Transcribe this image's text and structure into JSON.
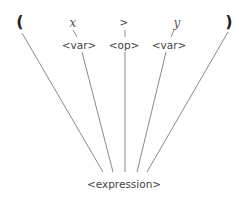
{
  "diagram": {
    "type": "parse-tree",
    "root": {
      "id": "expression",
      "label": "<expression>"
    },
    "leaves": [
      {
        "id": "lparen",
        "label": "("
      },
      {
        "id": "x",
        "label": "x"
      },
      {
        "id": "gt",
        "label": ">"
      },
      {
        "id": "y",
        "label": "y"
      },
      {
        "id": "rparen",
        "label": ")"
      }
    ],
    "nonterminals": [
      {
        "id": "var1",
        "label": "<var>",
        "child": "x"
      },
      {
        "id": "op",
        "label": "<op>",
        "child": ">"
      },
      {
        "id": "var2",
        "label": "<var>",
        "child": "y"
      }
    ],
    "edges": [
      [
        "expression",
        "lparen"
      ],
      [
        "expression",
        "var1"
      ],
      [
        "expression",
        "op"
      ],
      [
        "expression",
        "var2"
      ],
      [
        "expression",
        "rparen"
      ],
      [
        "var1",
        "x"
      ],
      [
        "op",
        "gt"
      ],
      [
        "var2",
        "y"
      ]
    ],
    "line_color": "#888888"
  }
}
